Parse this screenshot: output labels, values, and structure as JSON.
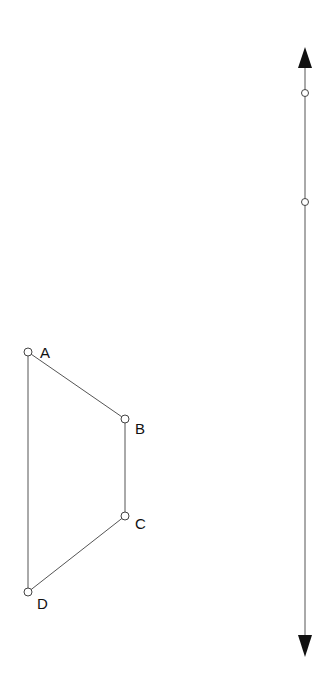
{
  "diagram": {
    "quadrilateral": {
      "points": [
        {
          "label": "A",
          "x": 28,
          "y": 352,
          "lx": 40,
          "ly": 358
        },
        {
          "label": "B",
          "x": 125,
          "y": 419,
          "lx": 135,
          "ly": 434
        },
        {
          "label": "C",
          "x": 125,
          "y": 516,
          "lx": 135,
          "ly": 529
        },
        {
          "label": "D",
          "x": 28,
          "y": 592,
          "lx": 37,
          "ly": 609
        }
      ],
      "edges": [
        [
          "A",
          "B"
        ],
        [
          "B",
          "C"
        ],
        [
          "C",
          "D"
        ],
        [
          "D",
          "A"
        ]
      ]
    },
    "line": {
      "x": 305,
      "y_top": 68,
      "y_bottom": 635,
      "arrow_top_tip": 47,
      "arrow_bottom_tip": 657,
      "points": [
        {
          "x": 305,
          "y": 93
        },
        {
          "x": 305,
          "y": 202
        }
      ]
    },
    "colors": {
      "stroke": "#555555",
      "arrow": "#111111",
      "background": "#ffffff"
    }
  }
}
